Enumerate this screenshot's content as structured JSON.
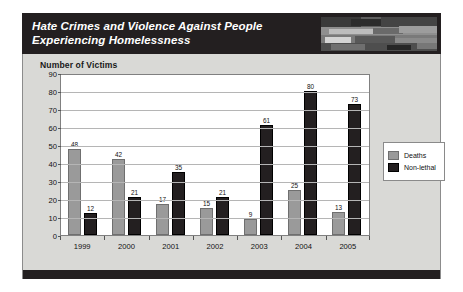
{
  "header": {
    "title_line1": "Hate Crimes and Violence Against People",
    "title_line2": "Experiencing Homelessness",
    "photo_alt": "header-photo"
  },
  "chart_heading": "Number of Victims",
  "chart_data": {
    "type": "bar",
    "title": "Number of Victims",
    "xlabel": "",
    "ylabel": "Number of Victims",
    "ylim": [
      0,
      90
    ],
    "ytick_step": 10,
    "yticks": [
      0,
      10,
      20,
      30,
      40,
      50,
      60,
      70,
      80,
      90
    ],
    "grid": true,
    "legend_position": "right",
    "categories": [
      "1999",
      "2000",
      "2001",
      "2002",
      "2003",
      "2004",
      "2005"
    ],
    "series": [
      {
        "name": "Deaths",
        "color": "#9a9a9a",
        "values": [
          48,
          42,
          17,
          15,
          9,
          25,
          13
        ]
      },
      {
        "name": "Non-lethal",
        "color": "#231f20",
        "values": [
          12,
          21,
          35,
          21,
          61,
          80,
          73
        ]
      }
    ]
  }
}
